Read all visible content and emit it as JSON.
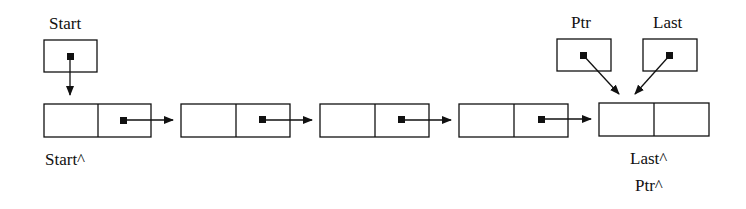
{
  "diagram": {
    "pointers": [
      {
        "id": "start",
        "label": "Start",
        "points_to": 0
      },
      {
        "id": "ptr",
        "label": "Ptr",
        "points_to": 4
      },
      {
        "id": "last",
        "label": "Last",
        "points_to": 4
      }
    ],
    "nodes": [
      {
        "index": 0,
        "has_next": true,
        "caption": "Start^"
      },
      {
        "index": 1,
        "has_next": true,
        "caption": ""
      },
      {
        "index": 2,
        "has_next": true,
        "caption": ""
      },
      {
        "index": 3,
        "has_next": true,
        "caption": ""
      },
      {
        "index": 4,
        "has_next": false,
        "caption_lines": [
          "Last^",
          "Ptr^"
        ]
      }
    ],
    "colors": {
      "stroke": "#111111",
      "background": "#ffffff"
    }
  }
}
